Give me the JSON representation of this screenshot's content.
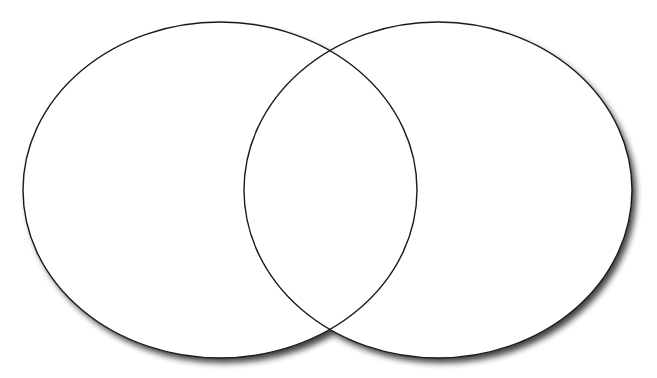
{
  "diagram": {
    "type": "venn",
    "sets": [
      {
        "name": "left-set",
        "label": "",
        "cx": 220,
        "cy": 190,
        "rx": 197,
        "ry": 168
      },
      {
        "name": "right-set",
        "label": "",
        "cx": 438,
        "cy": 190,
        "rx": 194,
        "ry": 168
      }
    ],
    "colors": {
      "background": "#ffffff",
      "fill": "#ffffff",
      "stroke": "#1a1a1a",
      "shadow": "#555555"
    }
  }
}
